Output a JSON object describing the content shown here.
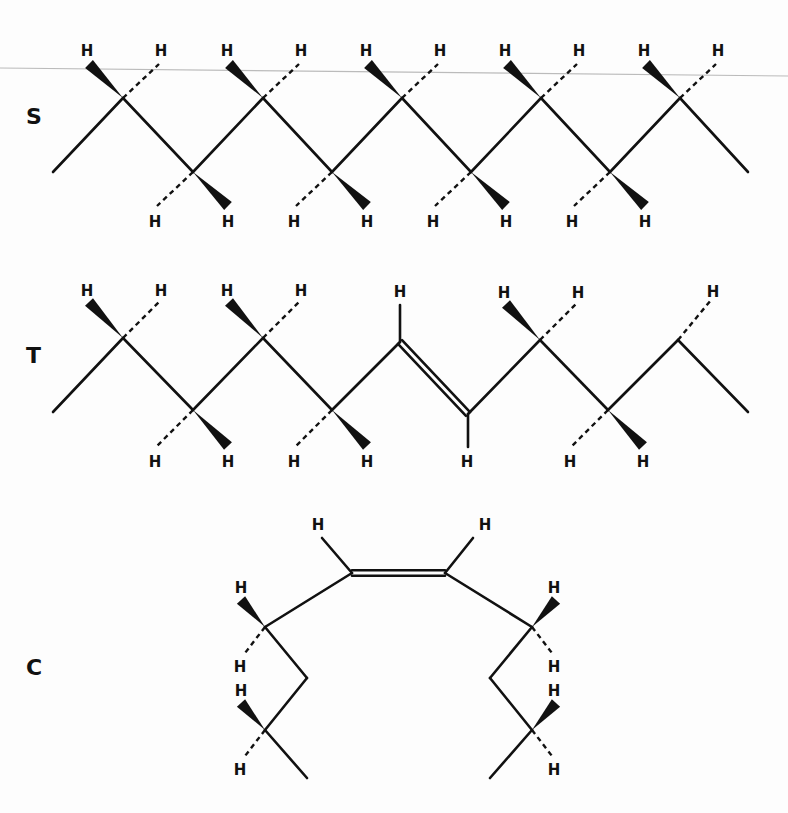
{
  "figure": {
    "structures": [
      {
        "id": "S",
        "label": "S",
        "type": "saturated zigzag chain",
        "h_label": "H"
      },
      {
        "id": "T",
        "label": "T",
        "type": "trans double bond chain",
        "h_label": "H"
      },
      {
        "id": "C",
        "label": "C",
        "type": "cis double bond chain",
        "h_label": "H"
      }
    ]
  },
  "colors": {
    "ink": "#111111",
    "background": "#fdfdfd",
    "rule": "#bbbbbb"
  }
}
